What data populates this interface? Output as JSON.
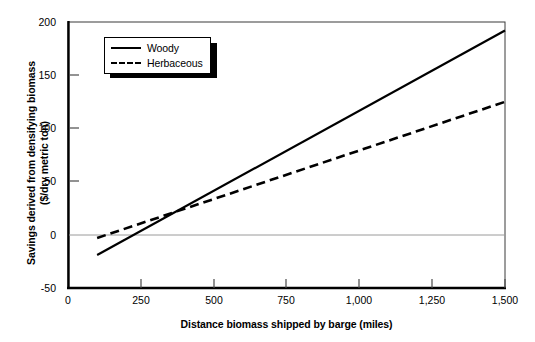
{
  "chart_data": {
    "type": "line",
    "title": "",
    "xlabel": "Distance biomass shipped by barge (miles)",
    "ylabel_line1": "Savings derived from densifying biomass",
    "ylabel_line2": "($/dry metric ton)",
    "xlim": [
      0,
      1500
    ],
    "ylim": [
      -50,
      200
    ],
    "xticks": [
      0,
      250,
      500,
      750,
      1000,
      1250,
      1500
    ],
    "xtick_labels": [
      "0",
      "250",
      "500",
      "750",
      "1,000",
      "1,250",
      "1,500"
    ],
    "yticks": [
      -50,
      0,
      50,
      100,
      150,
      200
    ],
    "ytick_labels": [
      "-50",
      "0",
      "50",
      "100",
      "150",
      "200"
    ],
    "grid": "zero-line-only",
    "legend_position": "upper-left-inside",
    "series": [
      {
        "name": "Woody",
        "style": "solid",
        "color": "#000000",
        "x": [
          100,
          1500
        ],
        "values": [
          -19,
          192
        ]
      },
      {
        "name": "Herbaceous",
        "style": "dashed",
        "color": "#000000",
        "x": [
          100,
          1500
        ],
        "values": [
          -3,
          125
        ]
      }
    ],
    "annotations": [
      {
        "text": "series cross near 360 miles at about $19/dry metric ton"
      }
    ]
  },
  "legend": {
    "items": [
      {
        "label": "Woody",
        "key": "solid-line-key"
      },
      {
        "label": "Herbaceous",
        "key": "dashed-line-key"
      }
    ]
  },
  "colors": {
    "axis": "#000000",
    "zero_gridline": "#9a9a9a",
    "background": "#ffffff",
    "series": "#000000"
  }
}
